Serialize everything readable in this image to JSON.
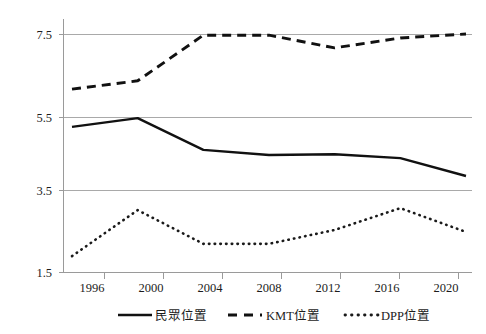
{
  "chart_data": {
    "type": "line",
    "title": "",
    "subtitle": "",
    "xlabel": "",
    "ylabel": "",
    "grid": true,
    "legend_position": "bottom",
    "x": [
      1996,
      2000,
      2004,
      2008,
      2012,
      2016,
      2020
    ],
    "categories": [
      "1996",
      "2000",
      "2004",
      "2008",
      "2012",
      "2016",
      "2020"
    ],
    "xlim": [
      1994,
      2022
    ],
    "ylim": [
      1.5,
      7.5
    ],
    "yticks": [
      1.5,
      3.5,
      5.5,
      7.5
    ],
    "ytick_labels": [
      "1.5",
      "3.5",
      "5.5",
      "7.5"
    ],
    "xtick_labels": [
      "1996",
      "2000",
      "2004",
      "2008",
      "2012",
      "2016",
      "2020"
    ],
    "series": [
      {
        "name": "民眾位置",
        "style": "solid",
        "color": "#111111",
        "values": [
          5.16,
          5.38,
          4.58,
          4.45,
          4.47,
          4.37,
          3.92
        ]
      },
      {
        "name": "KMT位置",
        "style": "dashed",
        "color": "#111111",
        "values": [
          6.11,
          6.32,
          7.47,
          7.47,
          7.15,
          7.4,
          7.5
        ]
      },
      {
        "name": "DPP位置",
        "style": "dotted",
        "color": "#1a1a1a",
        "values": [
          1.9,
          3.06,
          2.21,
          2.21,
          2.56,
          3.11,
          2.51
        ]
      }
    ]
  },
  "axes": {
    "y_labels": [
      "7.5",
      "5.5",
      "3.5",
      "1.5"
    ],
    "x_labels": [
      "1996",
      "2000",
      "2004",
      "2008",
      "2012",
      "2016",
      "2020"
    ]
  },
  "legend": {
    "items": [
      {
        "label": "民眾位置",
        "style": "solid"
      },
      {
        "label": "KMT位置",
        "style": "dashed"
      },
      {
        "label": "DPP位置",
        "style": "dotted"
      }
    ]
  }
}
